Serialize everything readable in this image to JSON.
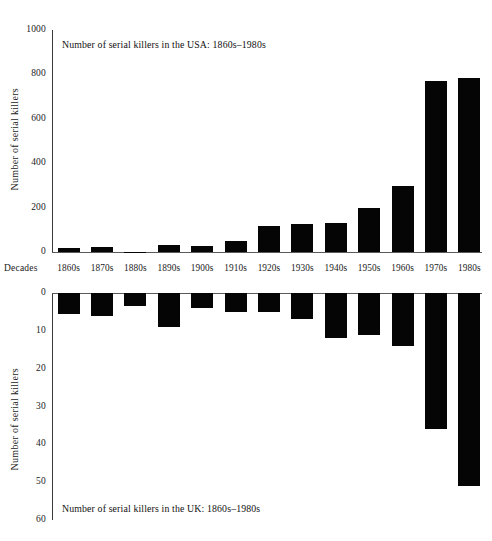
{
  "figure": {
    "categories_axis_name": "Decades",
    "categories": [
      "1860s",
      "1870s",
      "1880s",
      "1890s",
      "1900s",
      "1910s",
      "1920s",
      "1930s",
      "1940s",
      "1950s",
      "1960s",
      "1970s",
      "1980s"
    ],
    "bar_color": "#050505",
    "axis_color": "#3a3a3a",
    "background": "#ffffff"
  },
  "top_panel": {
    "title": "Number of serial killers in the USA: 1860s–1980s",
    "ylabel": "Number of serial killers",
    "yticks": [
      "1000",
      "800",
      "600",
      "400",
      "200",
      "0"
    ],
    "ytick_values": [
      1000,
      800,
      600,
      400,
      200,
      0
    ]
  },
  "bottom_panel": {
    "title": "Number of serial killers in the UK: 1860s–1980s",
    "ylabel": "Number of serial killers",
    "yticks": [
      "0",
      "10",
      "20",
      "30",
      "40",
      "50",
      "60"
    ],
    "ytick_values": [
      0,
      10,
      20,
      30,
      40,
      50,
      60
    ]
  },
  "chart_data": [
    {
      "type": "bar",
      "title": "Number of serial killers in the USA: 1860s–1980s",
      "xlabel": "Decades",
      "ylabel": "Number of serial killers",
      "categories": [
        "1860s",
        "1870s",
        "1880s",
        "1890s",
        "1900s",
        "1910s",
        "1920s",
        "1930s",
        "1940s",
        "1950s",
        "1960s",
        "1970s",
        "1980s"
      ],
      "values": [
        20,
        22,
        2,
        32,
        28,
        48,
        118,
        125,
        130,
        200,
        298,
        770,
        785
      ],
      "ylim": [
        0,
        1000
      ],
      "ytick_step": 200,
      "grid": false,
      "legend": null,
      "orientation": "vertical-up",
      "bar_color": "#050505"
    },
    {
      "type": "bar",
      "title": "Number of serial killers in the UK: 1860s–1980s",
      "xlabel": "Decades",
      "ylabel": "Number of serial killers",
      "categories": [
        "1860s",
        "1870s",
        "1880s",
        "1890s",
        "1900s",
        "1910s",
        "1920s",
        "1930s",
        "1940s",
        "1950s",
        "1960s",
        "1970s",
        "1980s"
      ],
      "values": [
        5.5,
        6,
        3.5,
        9,
        4,
        5,
        5,
        7,
        12,
        11,
        14,
        36,
        51
      ],
      "ylim": [
        0,
        60
      ],
      "ytick_step": 10,
      "grid": false,
      "legend": null,
      "orientation": "vertical-down",
      "bar_color": "#050505"
    }
  ]
}
